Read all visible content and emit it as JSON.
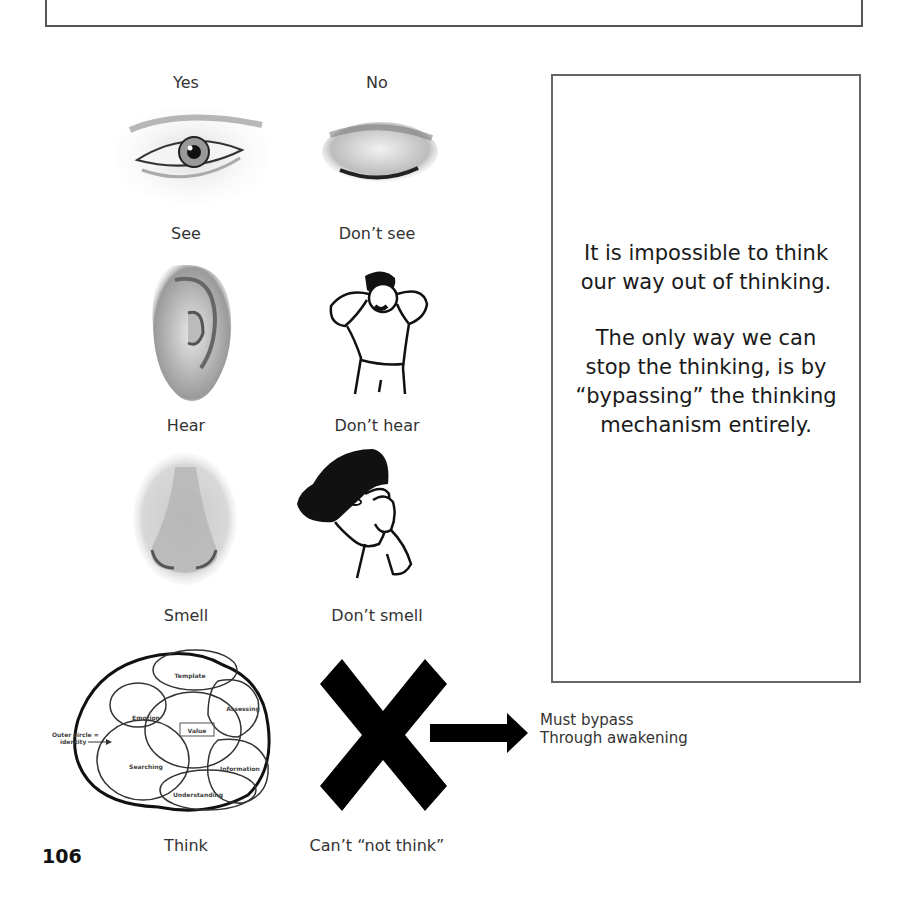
{
  "page": {
    "page_number": "106"
  },
  "sense_grid": {
    "column_headers": {
      "yes": "Yes",
      "no": "No"
    },
    "rows": [
      {
        "yes_icon": "open-eye-illustration",
        "no_icon": "closed-eye-illustration",
        "yes_label": "See",
        "no_label": "Don’t see"
      },
      {
        "yes_icon": "ear-illustration",
        "no_icon": "person-covering-ears-illustration",
        "yes_label": "Hear",
        "no_label": "Don’t hear"
      },
      {
        "yes_icon": "nose-illustration",
        "no_icon": "person-pinching-nose-illustration",
        "yes_label": "Smell",
        "no_label": "Don’t smell"
      },
      {
        "yes_icon": "thinking-diagram",
        "no_icon": "x-mark-icon",
        "yes_label": "Think",
        "no_label": "Can’t “not think”"
      }
    ]
  },
  "thinking_diagram": {
    "outer_label_line1": "Outer circle =",
    "outer_label_line2": "identity",
    "regions": [
      "Template",
      "Emotion",
      "Assessing",
      "Value",
      "Searching",
      "Information",
      "Understanding"
    ]
  },
  "bypass_note": {
    "line1": "Must bypass",
    "line2": "Through awakening"
  },
  "callout_box": {
    "paragraph1": "It is impossible to think our way out of thinking.",
    "paragraph2": "The only way we can stop the thinking, is by “bypassing” the thinking mechanism entirely."
  },
  "colors": {
    "border": "#555555",
    "text": "#222222",
    "mark": "#000000"
  }
}
